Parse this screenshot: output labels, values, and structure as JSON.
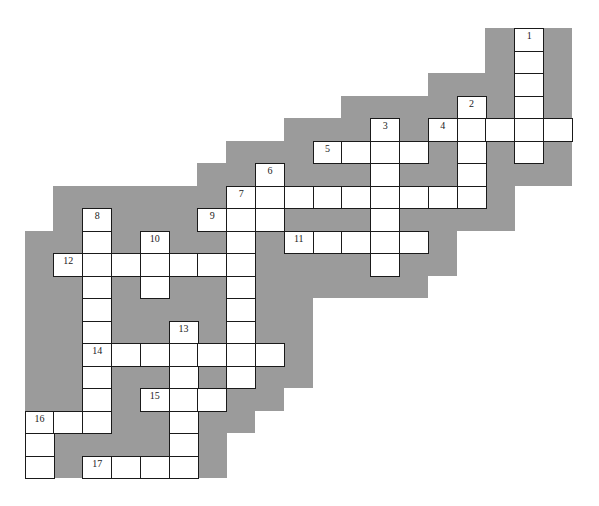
{
  "puzzle": {
    "title": "Crossword puzzle",
    "grid": {
      "origin_x": 24.5,
      "origin_y": 28,
      "cell_w": 28.8,
      "cell_h": 22.5,
      "cols": 19,
      "rows": 20
    },
    "colors": {
      "background": "#9b9b9b",
      "cell": "#ffffff",
      "border": "#1a1a1a"
    },
    "background_columns": [
      {
        "col": 0,
        "top": 9,
        "bottom": 20
      },
      {
        "col": 1,
        "top": 7,
        "bottom": 20
      },
      {
        "col": 2,
        "top": 7,
        "bottom": 20
      },
      {
        "col": 3,
        "top": 7,
        "bottom": 20
      },
      {
        "col": 4,
        "top": 7,
        "bottom": 20
      },
      {
        "col": 5,
        "top": 7,
        "bottom": 20
      },
      {
        "col": 6,
        "top": 6,
        "bottom": 20
      },
      {
        "col": 7,
        "top": 5,
        "bottom": 18
      },
      {
        "col": 8,
        "top": 5,
        "bottom": 17
      },
      {
        "col": 9,
        "top": 4,
        "bottom": 16
      },
      {
        "col": 10,
        "top": 4,
        "bottom": 12
      },
      {
        "col": 11,
        "top": 3,
        "bottom": 12
      },
      {
        "col": 12,
        "top": 3,
        "bottom": 12
      },
      {
        "col": 13,
        "top": 3,
        "bottom": 12
      },
      {
        "col": 14,
        "top": 2,
        "bottom": 11
      },
      {
        "col": 15,
        "top": 2,
        "bottom": 9
      },
      {
        "col": 16,
        "top": 0,
        "bottom": 9
      },
      {
        "col": 17,
        "top": 0,
        "bottom": 7
      },
      {
        "col": 18,
        "top": 0,
        "bottom": 7
      }
    ],
    "entries": [
      {
        "number": "1",
        "direction": "down",
        "row": 0,
        "col": 17,
        "length": 6
      },
      {
        "number": "2",
        "direction": "down",
        "row": 3,
        "col": 15,
        "length": 5
      },
      {
        "number": "3",
        "direction": "down",
        "row": 4,
        "col": 12,
        "length": 7
      },
      {
        "number": "4",
        "direction": "across",
        "row": 4,
        "col": 14,
        "length": 5
      },
      {
        "number": "5",
        "direction": "across",
        "row": 5,
        "col": 10,
        "length": 4
      },
      {
        "number": "6",
        "direction": "down",
        "row": 6,
        "col": 8,
        "length": 3
      },
      {
        "number": "7",
        "direction": "across",
        "row": 7,
        "col": 7,
        "length": 9
      },
      {
        "number": "7",
        "direction": "down",
        "row": 7,
        "col": 7,
        "length": 9
      },
      {
        "number": "8",
        "direction": "down",
        "row": 8,
        "col": 2,
        "length": 10
      },
      {
        "number": "9",
        "direction": "across",
        "row": 8,
        "col": 6,
        "length": 3
      },
      {
        "number": "10",
        "direction": "down",
        "row": 9,
        "col": 4,
        "length": 3
      },
      {
        "number": "11",
        "direction": "across",
        "row": 9,
        "col": 9,
        "length": 5
      },
      {
        "number": "12",
        "direction": "across",
        "row": 10,
        "col": 1,
        "length": 7
      },
      {
        "number": "13",
        "direction": "down",
        "row": 13,
        "col": 5,
        "length": 7
      },
      {
        "number": "14",
        "direction": "across",
        "row": 14,
        "col": 2,
        "length": 7
      },
      {
        "number": "15",
        "direction": "across",
        "row": 16,
        "col": 4,
        "length": 3
      },
      {
        "number": "16",
        "direction": "across",
        "row": 17,
        "col": 0,
        "length": 3
      },
      {
        "number": "16",
        "direction": "down",
        "row": 17,
        "col": 0,
        "length": 3
      },
      {
        "number": "17",
        "direction": "across",
        "row": 19,
        "col": 2,
        "length": 4
      }
    ]
  }
}
